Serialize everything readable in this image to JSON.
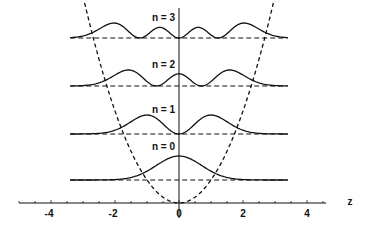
{
  "diagram": {
    "axis": {
      "label": "z",
      "ticks": [
        -4,
        -2,
        0,
        2,
        4
      ],
      "tick_labels": [
        "-4",
        "-2",
        "0",
        "2",
        "4"
      ],
      "range": [
        -5,
        4.6
      ]
    },
    "levels": [
      {
        "n": 0,
        "label": "n = 0",
        "energy": 0.5
      },
      {
        "n": 1,
        "label": "n = 1",
        "energy": 1.5
      },
      {
        "n": 2,
        "label": "n = 2",
        "energy": 2.5
      },
      {
        "n": 3,
        "label": "n = 3",
        "energy": 3.5
      }
    ],
    "potential": "V(z) = z^2 / 2 (dashed parabola)",
    "colors": {
      "line": "#111111",
      "background": "#ffffff"
    }
  }
}
